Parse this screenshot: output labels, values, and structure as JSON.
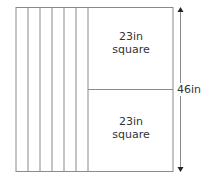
{
  "diagram": {
    "strips_count": 6,
    "squares": [
      {
        "line1": "23in",
        "line2": "square"
      },
      {
        "line1": "23in",
        "line2": "square"
      }
    ],
    "height_label": "46in",
    "colors": {
      "line": "#8a8a8a",
      "text": "#333333",
      "arrow": "#222222"
    }
  }
}
